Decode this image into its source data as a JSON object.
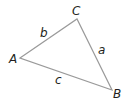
{
  "diagram": {
    "type": "triangle",
    "stroke_color": "#9a9a9a",
    "label_color": "#231f20",
    "vertices": [
      {
        "name": "A",
        "x": 20,
        "y": 58,
        "label_x": 9,
        "label_y": 63
      },
      {
        "name": "B",
        "x": 112,
        "y": 90,
        "label_x": 113,
        "label_y": 98
      },
      {
        "name": "C",
        "x": 77,
        "y": 19,
        "label_x": 72,
        "label_y": 15
      }
    ],
    "sides": [
      {
        "name": "a",
        "between": "B-C",
        "label_x": 98,
        "label_y": 54
      },
      {
        "name": "b",
        "between": "A-C",
        "label_x": 40,
        "label_y": 37
      },
      {
        "name": "c",
        "between": "A-B",
        "label_x": 55,
        "label_y": 84
      }
    ]
  }
}
